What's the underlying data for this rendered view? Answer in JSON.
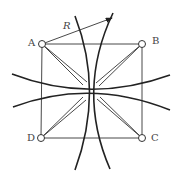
{
  "diagram": {
    "points": {
      "A": "A",
      "B": "B",
      "C": "C",
      "D": "D"
    },
    "radius_label": "R",
    "colors": {
      "stroke": "#222222",
      "text": "#444444",
      "background": "#ffffff"
    }
  }
}
